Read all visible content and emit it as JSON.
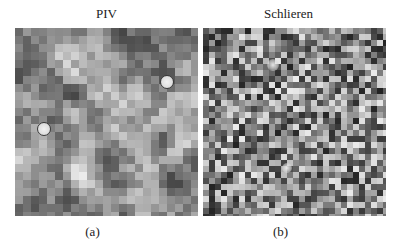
{
  "figure": {
    "panels": [
      {
        "id": "a",
        "title": "PIV",
        "caption": "(a)",
        "cell_size": 8,
        "seed": 17,
        "gray_range": [
          70,
          235
        ],
        "smooth": 2,
        "markers": [
          {
            "cx": 152,
            "cy": 54,
            "r": 7
          },
          {
            "cx": 29,
            "cy": 101,
            "r": 7
          }
        ],
        "spots": []
      },
      {
        "id": "b",
        "title": "Schlieren",
        "caption": "(b)",
        "cell_size": 6,
        "seed": 91,
        "gray_range": [
          35,
          235
        ],
        "smooth": 0,
        "markers": [],
        "spots": [
          {
            "cx": 70,
            "cy": 37,
            "r": 6
          },
          {
            "cx": 84,
            "cy": 140,
            "r": 5
          }
        ]
      }
    ]
  }
}
